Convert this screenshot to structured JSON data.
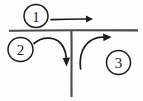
{
  "diagram": {
    "style": "hand-drawn sketch",
    "background_color": "#fefefe",
    "ink_color": "#1c1c1c",
    "road_color": "#4a4a4a",
    "roads": [
      {
        "name": "major-road-horizontal",
        "orientation": "horizontal",
        "x1": 9,
        "y1": 30.5,
        "x2": 138,
        "y2": 30.5
      },
      {
        "name": "minor-road-vertical",
        "orientation": "vertical",
        "x1": 71.5,
        "y1": 31,
        "x2": 71.5,
        "y2": 97
      }
    ],
    "movements": [
      {
        "id": "1",
        "label": "1",
        "description": "through movement along major road, left to right, above the junction",
        "marker_cx": 36,
        "marker_cy": 16,
        "marker_rx": 12,
        "marker_ry": 11.5,
        "path": "M 51 19.5 L 86 19",
        "arrowhead_points": "86,15.6 93,19 86,22.4",
        "direction": "right"
      },
      {
        "id": "2",
        "label": "2",
        "description": "left-turn movement from major road into minor road, curving downward",
        "marker_cx": 20.5,
        "marker_cy": 49.5,
        "marker_rx": 12.5,
        "marker_ry": 12,
        "path": "M 34 43.5 C 43 35.5, 57 36.5, 63 47 C 65.4 51.2, 66 55, 66.2 58",
        "arrowhead_points": "62.7,58.2 66.4,66.5 69.9,57.8",
        "direction": "down"
      },
      {
        "id": "3",
        "label": "3",
        "description": "right-turn movement from minor road onto major road, curving up to the right",
        "marker_cx": 118.5,
        "marker_cy": 62.5,
        "marker_rx": 12,
        "marker_ry": 12,
        "path": "M 80.5 69 C 79 56, 83 44, 93 39.5 C 97.5 37.4, 101 37.2, 104 37.4",
        "arrowhead_points": "103.2,33.6 111.5,37.1, 103.6,41.2",
        "direction": "up-right"
      }
    ]
  }
}
